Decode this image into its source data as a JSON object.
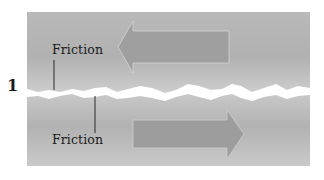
{
  "figure": {
    "number_label": "1",
    "labels": {
      "friction_top": "Friction",
      "friction_bottom": "Friction"
    },
    "arrows": {
      "top": {
        "direction": "left"
      },
      "bottom": {
        "direction": "right"
      }
    },
    "colors": {
      "panel_light": "#c9c9c9",
      "panel_mid": "#b8b8b8",
      "panel_dark": "#a9a9a9",
      "arrow_fill": "#9d9d9d",
      "crack": "#ffffff",
      "text": "#1a1a1a"
    }
  }
}
